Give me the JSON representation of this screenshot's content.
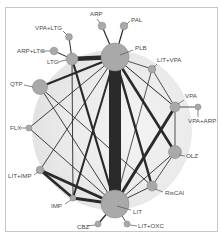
{
  "figure": {
    "type": "network-meta-analysis-graph",
    "background_circle_color": "#ececec",
    "node_fill": "#a9a9a9",
    "node_stroke": "#8a8a8a",
    "edge_color": "#2a2a2a",
    "label_color": "#4a4a4a"
  },
  "nodes": [
    {
      "id": "PLB",
      "label": "PLB",
      "x": 115,
      "y": 57,
      "r": 14,
      "lx": 135,
      "ly": 50,
      "anchor": "start",
      "line": [
        120,
        55,
        133,
        50
      ]
    },
    {
      "id": "ARP",
      "label": "ARP",
      "x": 102,
      "y": 26,
      "r": 3.8,
      "lx": 90,
      "ly": 16,
      "anchor": "start",
      "line": [
        100,
        23,
        97,
        19
      ]
    },
    {
      "id": "PAL",
      "label": "PAL",
      "x": 124,
      "y": 26,
      "r": 3.8,
      "lx": 131,
      "ly": 22,
      "anchor": "start",
      "line": [
        127,
        24,
        130,
        21
      ]
    },
    {
      "id": "VPA+LTG",
      "label": "VPA+LTG",
      "x": 69,
      "y": 37,
      "r": 3.4,
      "lx": 35,
      "ly": 30,
      "anchor": "start",
      "line": [
        67,
        35,
        63,
        31
      ]
    },
    {
      "id": "ARP+LTG",
      "label": "ARP+LTG",
      "x": 54,
      "y": 51,
      "r": 3.8,
      "lx": 17,
      "ly": 53,
      "anchor": "start",
      "line": [
        41,
        51,
        50,
        51
      ]
    },
    {
      "id": "LTG",
      "label": "LTG",
      "x": 72,
      "y": 59,
      "r": 6,
      "lx": 47,
      "ly": 64,
      "anchor": "start",
      "line": [
        58,
        62,
        66,
        60
      ]
    },
    {
      "id": "QTP",
      "label": "QTP",
      "x": 40,
      "y": 87,
      "r": 7.5,
      "lx": 10,
      "ly": 86,
      "anchor": "start",
      "line": [
        24,
        85,
        33,
        87
      ]
    },
    {
      "id": "LIT+VPA",
      "label": "LIT+VPA",
      "x": 152,
      "y": 69,
      "r": 3.8,
      "lx": 157,
      "ly": 62,
      "anchor": "start",
      "line": [
        154,
        67,
        157,
        64
      ]
    },
    {
      "id": "VPA",
      "label": "VPA",
      "x": 175,
      "y": 107,
      "r": 5,
      "lx": 185,
      "ly": 98,
      "anchor": "start",
      "line": [
        178,
        104,
        184,
        100
      ]
    },
    {
      "id": "VPA+ARP",
      "label": "VPA+ARP",
      "x": 198,
      "y": 107,
      "r": 3,
      "lx": 188,
      "ly": 123,
      "anchor": "start",
      "line": [
        198,
        110,
        198,
        117
      ]
    },
    {
      "id": "FLX",
      "label": "FLX",
      "x": 29,
      "y": 128,
      "r": 3,
      "lx": 10,
      "ly": 130,
      "anchor": "start",
      "line": [
        21,
        128,
        26,
        128
      ]
    },
    {
      "id": "OLZ",
      "label": "OLZ",
      "x": 175,
      "y": 152,
      "r": 6.5,
      "lx": 186,
      "ly": 158,
      "anchor": "start",
      "line": [
        179,
        155,
        185,
        156
      ]
    },
    {
      "id": "LIT+IMP",
      "label": "LIT+IMP",
      "x": 40,
      "y": 170,
      "r": 3.8,
      "lx": 8,
      "ly": 178,
      "anchor": "start",
      "line": [
        34,
        175,
        38,
        172
      ]
    },
    {
      "id": "RisCAI",
      "label": "RisCAI",
      "x": 152,
      "y": 186,
      "r": 5,
      "lx": 165,
      "ly": 195,
      "anchor": "start",
      "line": [
        155,
        189,
        163,
        192
      ]
    },
    {
      "id": "IMP",
      "label": "IMP",
      "x": 73,
      "y": 198,
      "r": 3,
      "lx": 51,
      "ly": 208,
      "anchor": "start",
      "line": [
        65,
        204,
        71,
        200
      ]
    },
    {
      "id": "LIT",
      "label": "LIT",
      "x": 115,
      "y": 204,
      "r": 14,
      "lx": 133,
      "ly": 214,
      "anchor": "start",
      "line": [
        117,
        206,
        131,
        210
      ]
    },
    {
      "id": "CBZ",
      "label": "CBZ",
      "x": 98,
      "y": 224,
      "r": 3,
      "lx": 77,
      "ly": 229,
      "anchor": "start",
      "line": [
        87,
        226,
        95,
        225
      ]
    },
    {
      "id": "LIT+OXC",
      "label": "LIT+OXC",
      "x": 127,
      "y": 224,
      "r": 3,
      "lx": 138,
      "ly": 228,
      "anchor": "start",
      "line": [
        130,
        225,
        137,
        226
      ]
    }
  ],
  "edges": [
    {
      "from": "PLB",
      "to": "LIT",
      "w": 12
    },
    {
      "from": "PLB",
      "to": "LTG",
      "w": 4.5
    },
    {
      "from": "PLB",
      "to": "ARP",
      "w": 1.2
    },
    {
      "from": "PLB",
      "to": "PAL",
      "w": 1.2
    },
    {
      "from": "PLB",
      "to": "QTP",
      "w": 2.2
    },
    {
      "from": "PLB",
      "to": "LIT+VPA",
      "w": 0.8
    },
    {
      "from": "PLB",
      "to": "VPA",
      "w": 1.0
    },
    {
      "from": "PLB",
      "to": "OLZ",
      "w": 2.6
    },
    {
      "from": "PLB",
      "to": "RisCAI",
      "w": 2.4
    },
    {
      "from": "PLB",
      "to": "IMP",
      "w": 2.0
    },
    {
      "from": "PLB",
      "to": "FLX",
      "w": 0.9
    },
    {
      "from": "PLB",
      "to": "LIT+IMP",
      "w": 0.9
    },
    {
      "from": "LTG",
      "to": "VPA+LTG",
      "w": 1.0
    },
    {
      "from": "LTG",
      "to": "ARP+LTG",
      "w": 1.0
    },
    {
      "from": "LTG",
      "to": "LIT",
      "w": 2.2
    },
    {
      "from": "LTG",
      "to": "IMP",
      "w": 0.9
    },
    {
      "from": "QTP",
      "to": "LIT",
      "w": 0.9
    },
    {
      "from": "QTP",
      "to": "RisCAI",
      "w": 0.9
    },
    {
      "from": "FLX",
      "to": "LIT",
      "w": 0.9
    },
    {
      "from": "LIT+VPA",
      "to": "LIT",
      "w": 0.8
    },
    {
      "from": "LIT+VPA",
      "to": "VPA",
      "w": 0.8
    },
    {
      "from": "VPA",
      "to": "VPA+ARP",
      "w": 0.8
    },
    {
      "from": "VPA",
      "to": "LIT",
      "w": 3.0
    },
    {
      "from": "VPA",
      "to": "OLZ",
      "w": 0.8
    },
    {
      "from": "OLZ",
      "to": "LIT",
      "w": 0.9
    },
    {
      "from": "OLZ",
      "to": "RisCAI",
      "w": 0.8
    },
    {
      "from": "LIT+IMP",
      "to": "LIT",
      "w": 3.0
    },
    {
      "from": "LIT+IMP",
      "to": "IMP",
      "w": 2.6
    },
    {
      "from": "IMP",
      "to": "LIT",
      "w": 3.2
    },
    {
      "from": "RisCAI",
      "to": "LIT",
      "w": 0.9
    },
    {
      "from": "LIT",
      "to": "CBZ",
      "w": 1.4
    },
    {
      "from": "LIT",
      "to": "LIT+OXC",
      "w": 0.8
    }
  ]
}
